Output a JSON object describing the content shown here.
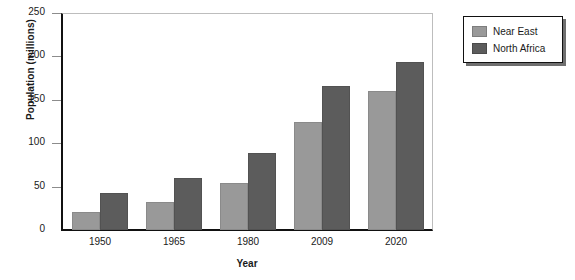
{
  "chart_data": {
    "type": "bar",
    "title": "",
    "xlabel": "Year",
    "ylabel": "Population (millions)",
    "categories": [
      "1950",
      "1965",
      "1980",
      "2009",
      "2020"
    ],
    "series": [
      {
        "name": "Near East",
        "color": "#999999",
        "values": [
          21,
          32,
          54,
          125,
          160
        ]
      },
      {
        "name": "North Africa",
        "color": "#5c5c5c",
        "values": [
          43,
          60,
          89,
          166,
          193
        ]
      }
    ],
    "ylim": [
      0,
      250
    ],
    "yticks": [
      0,
      50,
      100,
      150,
      200,
      250
    ],
    "ytick_labels": [
      "0",
      "50",
      "100",
      "150",
      "200",
      "250"
    ],
    "grid": false,
    "legend_position": "right-top"
  }
}
